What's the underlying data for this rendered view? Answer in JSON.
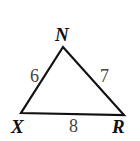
{
  "diagram": {
    "type": "triangle",
    "vertices": {
      "N": {
        "label": "N",
        "x": 63,
        "y": 47
      },
      "X": {
        "label": "X",
        "x": 21,
        "y": 113
      },
      "R": {
        "label": "R",
        "x": 124,
        "y": 115
      }
    },
    "sides": {
      "XN": {
        "label": "6"
      },
      "NR": {
        "label": "7"
      },
      "XR": {
        "label": "8"
      }
    },
    "colors": {
      "stroke": "#111111",
      "vertex_text": "#111111",
      "side_text": "#444444",
      "background": "#ffffff"
    }
  }
}
